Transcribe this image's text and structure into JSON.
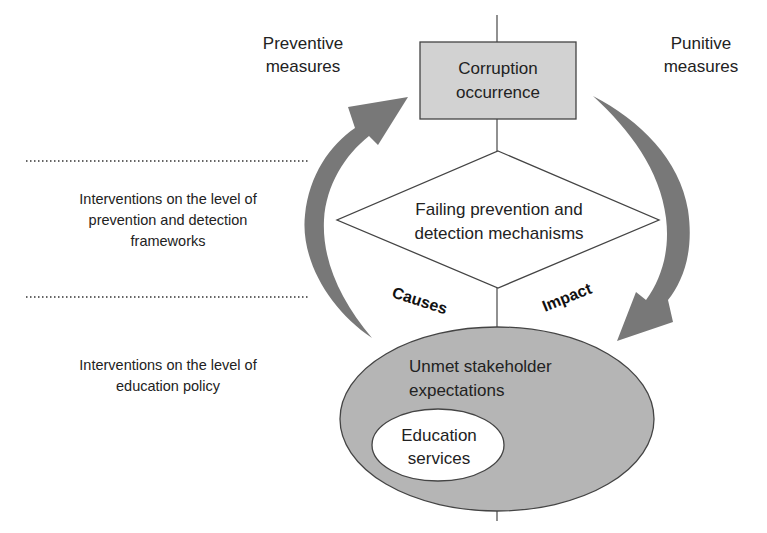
{
  "diagram": {
    "top_node": {
      "line1": "Corruption",
      "line2": "occurrence",
      "fill": "#d2d2d2"
    },
    "middle_node": {
      "line1": "Failing prevention and",
      "line2": "detection mechanisms"
    },
    "bottom_node": {
      "line1": "Unmet stakeholder",
      "line2": "expectations",
      "fill": "#b5b5b5",
      "inner": {
        "line1": "Education",
        "line2": "services"
      }
    },
    "left_arrow": {
      "label_line1": "Preventive",
      "label_line2": "measures",
      "color": "#787878"
    },
    "right_arrow": {
      "label_line1": "Punitive",
      "label_line2": "measures",
      "color": "#787878"
    },
    "edge_labels": {
      "causes": "Causes",
      "impact": "Impact"
    },
    "levels": [
      {
        "line1": "Interventions on the level of",
        "line2": "prevention and detection",
        "line3": "frameworks"
      },
      {
        "line1": "Interventions on the level of",
        "line2": "education policy"
      }
    ]
  }
}
